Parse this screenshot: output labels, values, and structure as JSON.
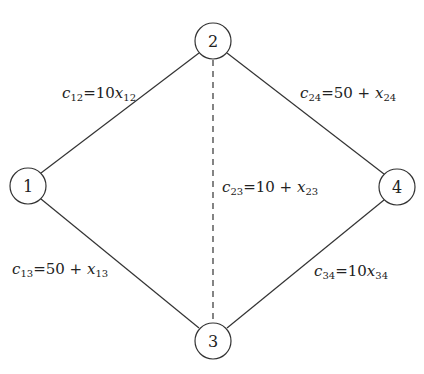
{
  "diagram": {
    "type": "network-graph",
    "nodes": [
      {
        "id": "1",
        "label": "1",
        "x": 28,
        "y": 186
      },
      {
        "id": "2",
        "label": "2",
        "x": 213,
        "y": 41
      },
      {
        "id": "3",
        "label": "3",
        "x": 213,
        "y": 341
      },
      {
        "id": "4",
        "label": "4",
        "x": 397,
        "y": 187
      }
    ],
    "edges": [
      {
        "from": "1",
        "to": "2",
        "style": "solid",
        "cost": {
          "var": "c",
          "sub": "12",
          "expr": "10",
          "xvar": "x",
          "xsub": "12",
          "op": ""
        }
      },
      {
        "from": "2",
        "to": "4",
        "style": "solid",
        "cost": {
          "var": "c",
          "sub": "24",
          "expr": "50",
          "xvar": "x",
          "xsub": "24",
          "op": "+"
        }
      },
      {
        "from": "2",
        "to": "3",
        "style": "dashed",
        "cost": {
          "var": "c",
          "sub": "23",
          "expr": "10",
          "xvar": "x",
          "xsub": "23",
          "op": "+"
        }
      },
      {
        "from": "1",
        "to": "3",
        "style": "solid",
        "cost": {
          "var": "c",
          "sub": "13",
          "expr": "50",
          "xvar": "x",
          "xsub": "13",
          "op": "+"
        }
      },
      {
        "from": "3",
        "to": "4",
        "style": "solid",
        "cost": {
          "var": "c",
          "sub": "34",
          "expr": "10",
          "xvar": "x",
          "xsub": "34",
          "op": ""
        }
      }
    ],
    "labels": {
      "c12": {
        "c": "c",
        "csub": "12",
        "eq": "=",
        "rhs": "10",
        "op": "",
        "x": "x",
        "xsub": "12"
      },
      "c24": {
        "c": "c",
        "csub": "24",
        "eq": "=",
        "rhs": "50",
        "op": " + ",
        "x": "x",
        "xsub": "24"
      },
      "c23": {
        "c": "c",
        "csub": "23",
        "eq": "=",
        "rhs": "10",
        "op": " + ",
        "x": "x",
        "xsub": "23"
      },
      "c13": {
        "c": "c",
        "csub": "13",
        "eq": "=",
        "rhs": "50",
        "op": " + ",
        "x": "x",
        "xsub": "13"
      },
      "c34": {
        "c": "c",
        "csub": "34",
        "eq": "=",
        "rhs": "10",
        "op": "",
        "x": "x",
        "xsub": "34"
      }
    },
    "colors": {
      "stroke": "#333333",
      "text": "#222222",
      "background": "#ffffff"
    }
  }
}
